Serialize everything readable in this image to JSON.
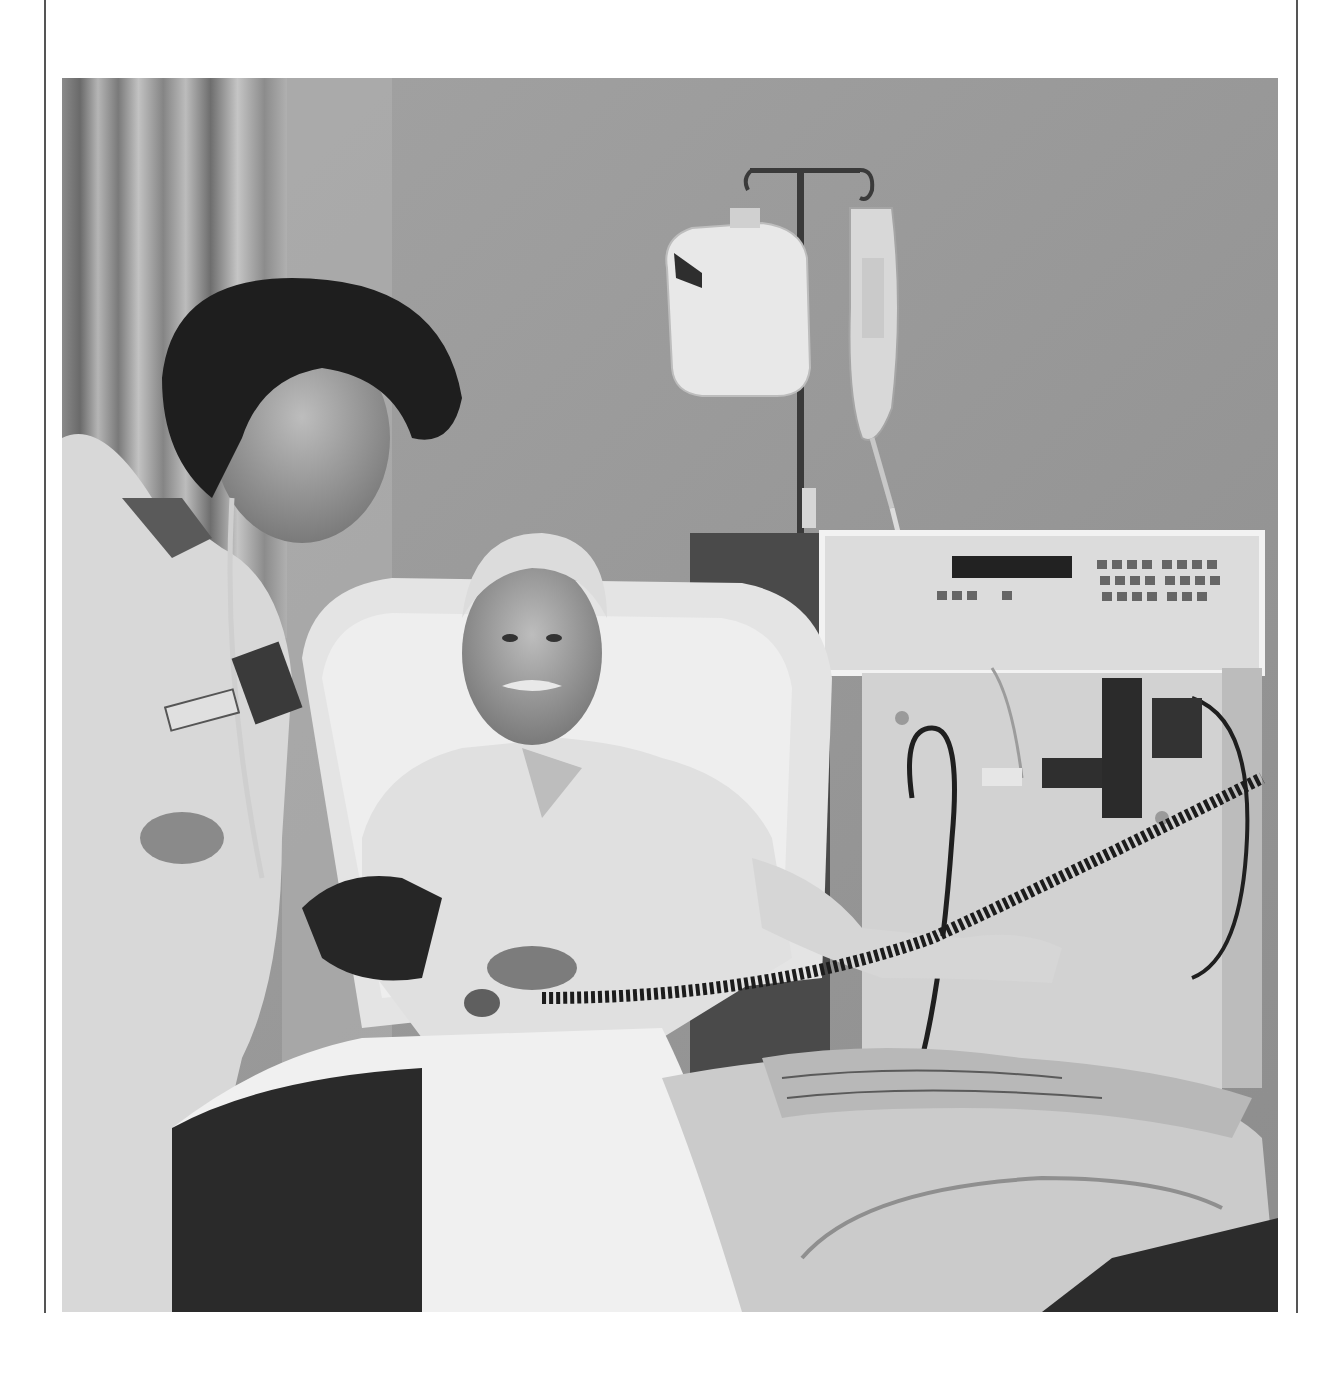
{
  "page": {
    "type": "photograph",
    "color_mode": "black-and-white"
  },
  "photo": {
    "elements": [
      "curtains",
      "wall",
      "iv-pole",
      "iv-jug",
      "iv-bag",
      "dialysis-machine",
      "machine-display",
      "machine-keypad",
      "nurse",
      "stethoscope",
      "patient",
      "recliner-chair",
      "blood-pressure-cuff",
      "coiled-cord",
      "blanket",
      "newspaper"
    ]
  },
  "colors": {
    "page_background": "#ffffff",
    "rule": "#555555",
    "wall": "#9a9a9a",
    "dark": "#2a2a2a",
    "light": "#e6e6e6"
  }
}
